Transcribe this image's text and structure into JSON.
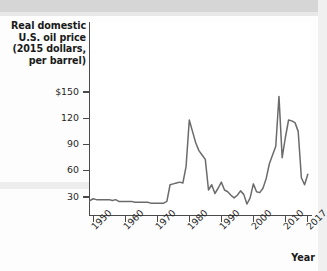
{
  "chart_data": {
    "type": "line",
    "title": "Real domestic U.S. oil price (2015 dollars, per barrel)",
    "xlabel": "Year",
    "ylabel": "",
    "xlim": [
      1949,
      2018
    ],
    "ylim": [
      0,
      160
    ],
    "grid": false,
    "legend": null,
    "ytick_labels": [
      "$150",
      "120",
      "90",
      "60",
      "30"
    ],
    "ytick_values": [
      150,
      120,
      90,
      60,
      30
    ],
    "xtick_labels": [
      "1950",
      "1960",
      "1970",
      "1980",
      "1990",
      "2000",
      "2010",
      "2017"
    ],
    "xtick_values": [
      1950,
      1960,
      1970,
      1980,
      1990,
      2000,
      2010,
      2017
    ],
    "line_color": "#6b6b6b",
    "series": [
      {
        "name": "Real domestic U.S. oil price",
        "x": [
          1949,
          1950,
          1951,
          1952,
          1953,
          1954,
          1955,
          1956,
          1957,
          1958,
          1959,
          1960,
          1961,
          1962,
          1963,
          1964,
          1965,
          1966,
          1967,
          1968,
          1969,
          1970,
          1971,
          1972,
          1973,
          1974,
          1975,
          1976,
          1977,
          1978,
          1979,
          1980,
          1981,
          1982,
          1983,
          1984,
          1985,
          1986,
          1987,
          1988,
          1989,
          1990,
          1991,
          1992,
          1993,
          1994,
          1995,
          1996,
          1997,
          1998,
          1999,
          2000,
          2001,
          2002,
          2003,
          2004,
          2005,
          2006,
          2007,
          2008,
          2009,
          2010,
          2011,
          2012,
          2013,
          2014,
          2015,
          2016,
          2017
        ],
        "y": [
          26,
          28,
          27,
          27,
          27,
          27,
          27,
          26,
          27,
          25,
          25,
          25,
          25,
          25,
          24,
          24,
          24,
          24,
          24,
          23,
          23,
          23,
          23,
          23,
          25,
          44,
          45,
          46,
          47,
          46,
          65,
          118,
          105,
          92,
          83,
          78,
          73,
          38,
          44,
          34,
          40,
          47,
          38,
          36,
          32,
          29,
          32,
          37,
          33,
          22,
          29,
          45,
          36,
          35,
          40,
          51,
          68,
          78,
          88,
          145,
          75,
          98,
          118,
          117,
          115,
          105,
          52,
          44,
          56
        ],
        "peak_1980": 118,
        "peak_2008": 145,
        "trough_1998": 22
      }
    ]
  },
  "figure": {
    "title_lines": [
      "Real domestic",
      "U.S. oil price",
      "(2015 dollars,",
      "per barrel)"
    ],
    "year_axis_label": "Year"
  }
}
